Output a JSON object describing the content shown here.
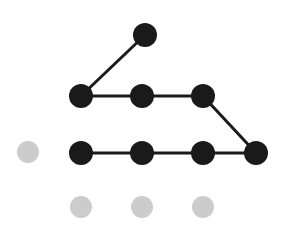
{
  "figure": {
    "width": 282,
    "height": 233,
    "background_color": "#ffffff"
  },
  "style": {
    "active_node_color": "#1a1a1a",
    "inactive_node_color": "#cccccc",
    "edge_color": "#1a1a1a",
    "node_radius": 12,
    "inactive_node_radius": 11,
    "edge_width": 3
  },
  "chart_data": {
    "type": "scatter",
    "title": "",
    "xlabel": "",
    "ylabel": "",
    "grid": false,
    "legend": "none",
    "xlim": [
      0,
      282
    ],
    "ylim": [
      0,
      233
    ],
    "nodes": [
      {
        "id": "n0",
        "label": "",
        "x": 145,
        "y": 35,
        "state": "active",
        "color": "#1a1a1a",
        "radius": 12
      },
      {
        "id": "n1",
        "label": "",
        "x": 81,
        "y": 96,
        "state": "active",
        "color": "#1a1a1a",
        "radius": 12
      },
      {
        "id": "n2",
        "label": "",
        "x": 142,
        "y": 96,
        "state": "active",
        "color": "#1a1a1a",
        "radius": 12
      },
      {
        "id": "n3",
        "label": "",
        "x": 203,
        "y": 96,
        "state": "active",
        "color": "#1a1a1a",
        "radius": 12
      },
      {
        "id": "n4",
        "label": "",
        "x": 81,
        "y": 153,
        "state": "active",
        "color": "#1a1a1a",
        "radius": 12
      },
      {
        "id": "n5",
        "label": "",
        "x": 142,
        "y": 153,
        "state": "active",
        "color": "#1a1a1a",
        "radius": 12
      },
      {
        "id": "n6",
        "label": "",
        "x": 203,
        "y": 153,
        "state": "active",
        "color": "#1a1a1a",
        "radius": 12
      },
      {
        "id": "n7",
        "label": "",
        "x": 256,
        "y": 153,
        "state": "active",
        "color": "#1a1a1a",
        "radius": 12
      },
      {
        "id": "g0",
        "label": "",
        "x": 28,
        "y": 152,
        "state": "inactive",
        "color": "#cccccc",
        "radius": 11
      },
      {
        "id": "g1",
        "label": "",
        "x": 81,
        "y": 207,
        "state": "inactive",
        "color": "#cccccc",
        "radius": 11
      },
      {
        "id": "g2",
        "label": "",
        "x": 142,
        "y": 207,
        "state": "inactive",
        "color": "#cccccc",
        "radius": 11
      },
      {
        "id": "g3",
        "label": "",
        "x": 203,
        "y": 207,
        "state": "inactive",
        "color": "#cccccc",
        "radius": 11
      }
    ],
    "edges": [
      {
        "id": "e0",
        "from": "n1",
        "to": "n0",
        "x1": 81,
        "y1": 96,
        "x2": 145,
        "y2": 35,
        "color": "#1a1a1a",
        "width": 3
      },
      {
        "id": "e1",
        "from": "n1",
        "to": "n2",
        "x1": 81,
        "y1": 96,
        "x2": 142,
        "y2": 96,
        "color": "#1a1a1a",
        "width": 3
      },
      {
        "id": "e2",
        "from": "n2",
        "to": "n3",
        "x1": 142,
        "y1": 96,
        "x2": 203,
        "y2": 96,
        "color": "#1a1a1a",
        "width": 3
      },
      {
        "id": "e3",
        "from": "n3",
        "to": "n7",
        "x1": 203,
        "y1": 96,
        "x2": 256,
        "y2": 153,
        "color": "#1a1a1a",
        "width": 3
      },
      {
        "id": "e4",
        "from": "n4",
        "to": "n5",
        "x1": 81,
        "y1": 153,
        "x2": 142,
        "y2": 153,
        "color": "#1a1a1a",
        "width": 3
      },
      {
        "id": "e5",
        "from": "n5",
        "to": "n6",
        "x1": 142,
        "y1": 153,
        "x2": 203,
        "y2": 153,
        "color": "#1a1a1a",
        "width": 3
      },
      {
        "id": "e6",
        "from": "n6",
        "to": "n7",
        "x1": 203,
        "y1": 153,
        "x2": 256,
        "y2": 153,
        "color": "#1a1a1a",
        "width": 3
      }
    ]
  }
}
